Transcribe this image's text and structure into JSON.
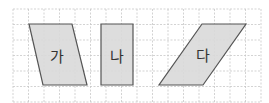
{
  "grid": {
    "x0": 13,
    "y0": 9,
    "cols": 16,
    "rows": 6,
    "cell": 15.5,
    "line_color": "#c8c8c8",
    "border_color": "#bdbdbd"
  },
  "shapes": [
    {
      "label": "가",
      "type": "parallelogram",
      "points": "29,24 72,24 87,85 43,85",
      "label_pos": [
        57,
        55
      ]
    },
    {
      "label": "나",
      "type": "rectangle",
      "points": "101,24 133,24 133,85 101,85",
      "label_pos": [
        117,
        55
      ]
    },
    {
      "label": "다",
      "type": "parallelogram",
      "points": "202,24 246,24 203,85 159,85",
      "label_pos": [
        203,
        54
      ]
    }
  ],
  "colors": {
    "fill": "#d9d9d9",
    "stroke": "#555555"
  }
}
